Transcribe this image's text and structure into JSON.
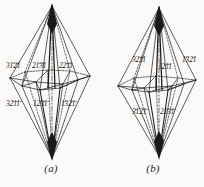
{
  "figure": {
    "background_color": "#fbfaf8",
    "line_color": "#1a1a1a",
    "panel_count": 2
  },
  "panels": [
    {
      "id": "a",
      "caption": "(a)",
      "handedness": "left",
      "labels": {
        "upper": [
          {
            "digits": "3121",
            "bars": [
              false,
              true,
              true,
              false
            ],
            "text": "31̄2̄1"
          },
          {
            "digits": "2131",
            "bars": [
              false,
              true,
              true,
              false
            ],
            "text": "21̄3̄1"
          },
          {
            "digits": "2211",
            "bars": [
              false,
              true,
              true,
              false
            ],
            "text": "22̄1̄1"
          }
        ],
        "lower": [
          {
            "digits": "3211",
            "bars": [
              false,
              true,
              true,
              true
            ],
            "text": "32̄1̄1̄"
          },
          {
            "digits": "1231",
            "bars": [
              false,
              true,
              true,
              true
            ],
            "text": "12̄3̄1̄"
          },
          {
            "digits": "1321",
            "bars": [
              true,
              false,
              true,
              true
            ],
            "text": "1̄32̄1̄"
          }
        ]
      }
    },
    {
      "id": "b",
      "caption": "(b)",
      "handedness": "right",
      "labels": {
        "upper": [
          {
            "digits": "3211",
            "bars": [
              false,
              true,
              true,
              false
            ],
            "text": "32̄1̄1"
          },
          {
            "digits": "1211",
            "bars": [
              false,
              true,
              true,
              false
            ],
            "text": "12̄1̄1"
          },
          {
            "digits": "1321",
            "bars": [
              true,
              false,
              true,
              false
            ],
            "text": "1̄32̄1"
          }
        ],
        "lower": [
          {
            "digits": "3121",
            "bars": [
              true,
              false,
              true,
              true
            ],
            "text": "3̄12̄1̄"
          },
          {
            "digits": "2131",
            "bars": [
              false,
              true,
              true,
              true
            ],
            "text": "21̄3̄1̄"
          }
        ]
      }
    }
  ]
}
